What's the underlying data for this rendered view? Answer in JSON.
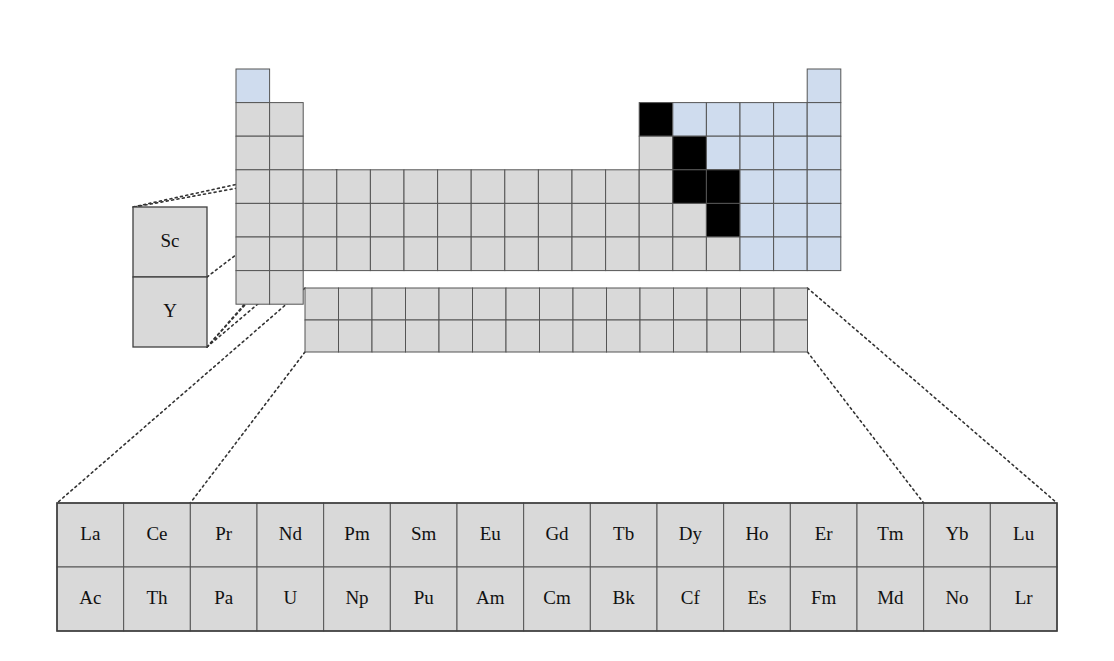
{
  "figure": {
    "kind": "periodic-table-diagram"
  },
  "colors": {
    "grey_fill": "#d9d9d9",
    "blue_fill": "#cfdcee",
    "black_fill": "#000000",
    "cell_stroke": "#555555",
    "outer_stroke": "#3f3f3f",
    "leader_line": "#333333",
    "background": "#ffffff",
    "text": "#111111"
  },
  "geometry": {
    "main_cell": 33.6,
    "main_origin_x": 236,
    "main_origin_y": 69,
    "fstrip_cell_w": 33.5,
    "fstrip_cell_h": 32,
    "fstrip_x": 305,
    "fstrip_y": 288,
    "callout_x": 133,
    "callout_y": 207,
    "callout_w": 74,
    "callout_h": 70,
    "bottom_x": 57,
    "bottom_y": 503,
    "bottom_w": 1000,
    "bottom_h": 128,
    "bottom_cols": 15,
    "bottom_rows": 2
  },
  "main_table": {
    "name": "main-periodic-grid",
    "rows": 7,
    "columns": 18,
    "cells": [
      {
        "group": 1,
        "period": 1,
        "fill": "blue"
      },
      {
        "group": 18,
        "period": 1,
        "fill": "blue"
      },
      {
        "group": 1,
        "period": 2,
        "fill": "grey"
      },
      {
        "group": 2,
        "period": 2,
        "fill": "grey"
      },
      {
        "group": 13,
        "period": 2,
        "fill": "black"
      },
      {
        "group": 14,
        "period": 2,
        "fill": "blue"
      },
      {
        "group": 15,
        "period": 2,
        "fill": "blue"
      },
      {
        "group": 16,
        "period": 2,
        "fill": "blue"
      },
      {
        "group": 17,
        "period": 2,
        "fill": "blue"
      },
      {
        "group": 18,
        "period": 2,
        "fill": "blue"
      },
      {
        "group": 1,
        "period": 3,
        "fill": "grey"
      },
      {
        "group": 2,
        "period": 3,
        "fill": "grey"
      },
      {
        "group": 13,
        "period": 3,
        "fill": "grey"
      },
      {
        "group": 14,
        "period": 3,
        "fill": "black"
      },
      {
        "group": 15,
        "period": 3,
        "fill": "blue"
      },
      {
        "group": 16,
        "period": 3,
        "fill": "blue"
      },
      {
        "group": 17,
        "period": 3,
        "fill": "blue"
      },
      {
        "group": 18,
        "period": 3,
        "fill": "blue"
      },
      {
        "group": 1,
        "period": 4,
        "fill": "grey"
      },
      {
        "group": 2,
        "period": 4,
        "fill": "grey"
      },
      {
        "group": 3,
        "period": 4,
        "fill": "grey"
      },
      {
        "group": 4,
        "period": 4,
        "fill": "grey"
      },
      {
        "group": 5,
        "period": 4,
        "fill": "grey"
      },
      {
        "group": 6,
        "period": 4,
        "fill": "grey"
      },
      {
        "group": 7,
        "period": 4,
        "fill": "grey"
      },
      {
        "group": 8,
        "period": 4,
        "fill": "grey"
      },
      {
        "group": 9,
        "period": 4,
        "fill": "grey"
      },
      {
        "group": 10,
        "period": 4,
        "fill": "grey"
      },
      {
        "group": 11,
        "period": 4,
        "fill": "grey"
      },
      {
        "group": 12,
        "period": 4,
        "fill": "grey"
      },
      {
        "group": 13,
        "period": 4,
        "fill": "grey"
      },
      {
        "group": 14,
        "period": 4,
        "fill": "black"
      },
      {
        "group": 15,
        "period": 4,
        "fill": "black"
      },
      {
        "group": 16,
        "period": 4,
        "fill": "blue"
      },
      {
        "group": 17,
        "period": 4,
        "fill": "blue"
      },
      {
        "group": 18,
        "period": 4,
        "fill": "blue"
      },
      {
        "group": 1,
        "period": 5,
        "fill": "grey"
      },
      {
        "group": 2,
        "period": 5,
        "fill": "grey"
      },
      {
        "group": 3,
        "period": 5,
        "fill": "grey"
      },
      {
        "group": 4,
        "period": 5,
        "fill": "grey"
      },
      {
        "group": 5,
        "period": 5,
        "fill": "grey"
      },
      {
        "group": 6,
        "period": 5,
        "fill": "grey"
      },
      {
        "group": 7,
        "period": 5,
        "fill": "grey"
      },
      {
        "group": 8,
        "period": 5,
        "fill": "grey"
      },
      {
        "group": 9,
        "period": 5,
        "fill": "grey"
      },
      {
        "group": 10,
        "period": 5,
        "fill": "grey"
      },
      {
        "group": 11,
        "period": 5,
        "fill": "grey"
      },
      {
        "group": 12,
        "period": 5,
        "fill": "grey"
      },
      {
        "group": 13,
        "period": 5,
        "fill": "grey"
      },
      {
        "group": 14,
        "period": 5,
        "fill": "grey"
      },
      {
        "group": 15,
        "period": 5,
        "fill": "black"
      },
      {
        "group": 16,
        "period": 5,
        "fill": "blue"
      },
      {
        "group": 17,
        "period": 5,
        "fill": "blue"
      },
      {
        "group": 18,
        "period": 5,
        "fill": "blue"
      },
      {
        "group": 1,
        "period": 6,
        "fill": "grey"
      },
      {
        "group": 2,
        "period": 6,
        "fill": "grey"
      },
      {
        "group": 3,
        "period": 6,
        "fill": "grey"
      },
      {
        "group": 4,
        "period": 6,
        "fill": "grey"
      },
      {
        "group": 5,
        "period": 6,
        "fill": "grey"
      },
      {
        "group": 6,
        "period": 6,
        "fill": "grey"
      },
      {
        "group": 7,
        "period": 6,
        "fill": "grey"
      },
      {
        "group": 8,
        "period": 6,
        "fill": "grey"
      },
      {
        "group": 9,
        "period": 6,
        "fill": "grey"
      },
      {
        "group": 10,
        "period": 6,
        "fill": "grey"
      },
      {
        "group": 11,
        "period": 6,
        "fill": "grey"
      },
      {
        "group": 12,
        "period": 6,
        "fill": "grey"
      },
      {
        "group": 13,
        "period": 6,
        "fill": "grey"
      },
      {
        "group": 14,
        "period": 6,
        "fill": "grey"
      },
      {
        "group": 15,
        "period": 6,
        "fill": "grey"
      },
      {
        "group": 16,
        "period": 6,
        "fill": "blue"
      },
      {
        "group": 17,
        "period": 6,
        "fill": "blue"
      },
      {
        "group": 18,
        "period": 6,
        "fill": "blue"
      },
      {
        "group": 1,
        "period": 7,
        "fill": "grey"
      },
      {
        "group": 2,
        "period": 7,
        "fill": "grey"
      }
    ]
  },
  "fblock_strip": {
    "name": "fblock-strip",
    "rows": 2,
    "columns": 15,
    "fill": "grey"
  },
  "callout_sc_y": {
    "name": "group3-callout",
    "cells": [
      {
        "label": "Sc"
      },
      {
        "label": "Y"
      }
    ]
  },
  "bottom_table": {
    "name": "fblock-expanded-table",
    "rows": [
      {
        "series": "lanthanides",
        "labels": [
          "La",
          "Ce",
          "Pr",
          "Nd",
          "Pm",
          "Sm",
          "Eu",
          "Gd",
          "Tb",
          "Dy",
          "Ho",
          "Er",
          "Tm",
          "Yb",
          "Lu"
        ]
      },
      {
        "series": "actinides",
        "labels": [
          "Ac",
          "Th",
          "Pa",
          "U",
          "Np",
          "Pu",
          "Am",
          "Cm",
          "Bk",
          "Cf",
          "Es",
          "Fm",
          "Md",
          "No",
          "Lr"
        ]
      }
    ]
  },
  "leader_lines": {
    "name": "leader-lines",
    "count": 8,
    "style": "dotted",
    "groups": [
      {
        "from": "group3-callout",
        "to": "main-grid-group3-cells"
      },
      {
        "from": "fblock-strip",
        "to": "fblock-expanded-table"
      }
    ]
  }
}
